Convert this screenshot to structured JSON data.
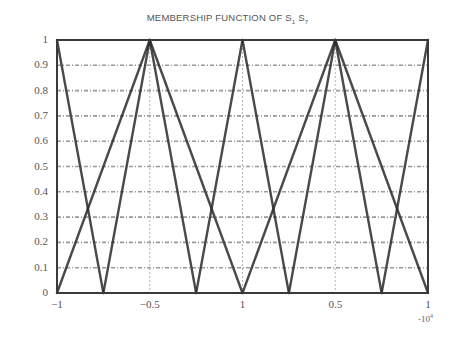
{
  "chart_data": {
    "type": "line",
    "title": "MEMBERSHIP FUNCTION OF S1 S7",
    "title_main": "MEMBERSHIP FUNCTION OF S",
    "title_sub1": "1",
    "title_mid": " S",
    "title_sub2": "7",
    "xlabel": "",
    "ylabel": "",
    "x_multiplier": "-10",
    "x_multiplier_exp": "4",
    "xlim": [
      -1,
      1
    ],
    "ylim": [
      0,
      1
    ],
    "grid": true,
    "x_ticks": [
      -1,
      -0.5,
      0,
      0.5,
      1
    ],
    "x_tick_labels": [
      "-1",
      "-0.5",
      "1",
      "0.5",
      "1"
    ],
    "y_ticks": [
      0,
      0.1,
      0.2,
      0.3,
      0.4,
      0.5,
      0.6,
      0.7,
      0.8,
      0.9,
      1
    ],
    "y_tick_labels": [
      "0",
      "0.1",
      "0.2",
      "0.3",
      "0.4",
      "0.5",
      "0.6",
      "0.7",
      "0.8",
      "0.9",
      "1"
    ],
    "series": [
      {
        "name": "S1",
        "x": [
          -1,
          -0.75
        ],
        "y": [
          1,
          0
        ]
      },
      {
        "name": "S2",
        "x": [
          -1,
          -0.75,
          -0.5
        ],
        "y": [
          0,
          1,
          0
        ],
        "note": "rising from -1 to peak"
      },
      {
        "name": "S3",
        "x": [
          -0.75,
          -0.5,
          -0.25
        ],
        "y": [
          0,
          1,
          0
        ]
      },
      {
        "name": "S4",
        "x": [
          -0.25,
          0,
          0.25
        ],
        "y": [
          0,
          1,
          0
        ]
      },
      {
        "name": "S5",
        "x": [
          0.25,
          0.5,
          0.75
        ],
        "y": [
          0,
          1,
          0
        ]
      },
      {
        "name": "S6",
        "x": [
          0.75,
          1
        ],
        "y": [
          0,
          1
        ]
      },
      {
        "name": "S7",
        "x": [
          0.75,
          1
        ],
        "y": [
          0,
          1
        ]
      }
    ],
    "line_segments": [
      {
        "x": [
          -1,
          -0.75
        ],
        "y": [
          1,
          0
        ]
      },
      {
        "x": [
          -1,
          -0.75
        ],
        "y": [
          0,
          0
        ]
      },
      {
        "x": [
          -0.75,
          -0.5
        ],
        "y": [
          0,
          1
        ]
      },
      {
        "x": [
          -0.5,
          -0.25
        ],
        "y": [
          1,
          0
        ]
      },
      {
        "x": [
          -0.25,
          0
        ],
        "y": [
          0,
          1
        ]
      },
      {
        "x": [
          0,
          0.25
        ],
        "y": [
          1,
          0
        ]
      },
      {
        "x": [
          0.25,
          0.5
        ],
        "y": [
          0,
          1
        ]
      },
      {
        "x": [
          0.5,
          0.75
        ],
        "y": [
          1,
          0
        ]
      },
      {
        "x": [
          0.75,
          1
        ],
        "y": [
          0,
          1
        ]
      },
      {
        "x": [
          -1,
          -0.5
        ],
        "y": [
          0,
          1
        ]
      },
      {
        "x": [
          -0.5,
          0
        ],
        "y": [
          1,
          0
        ]
      },
      {
        "x": [
          0,
          0.5
        ],
        "y": [
          0,
          1
        ]
      },
      {
        "x": [
          0.5,
          1
        ],
        "y": [
          1,
          0
        ]
      }
    ],
    "colors": {
      "line": "#2b2b2b",
      "grid": "#9a9a9a",
      "frame": "#3a3a3a"
    }
  }
}
